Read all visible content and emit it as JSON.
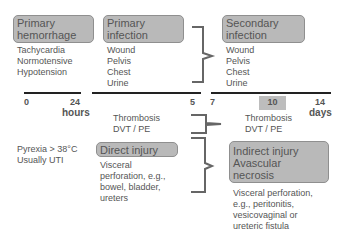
{
  "boxes": {
    "primary_hemorrhage": "Primary hemorrhage",
    "primary_infection": "Primary infection",
    "secondary_infection": "Secondary infection",
    "direct_injury": "Direct injury",
    "indirect_injury": "Indirect injury Avascular necrosis"
  },
  "lists": {
    "hemorrhage_signs": [
      "Tachycardia",
      "Normotensive",
      "Hypotension"
    ],
    "primary_infection_sites": [
      "Wound",
      "Pelvis",
      "Chest",
      "Urine"
    ],
    "secondary_infection_sites": [
      "Wound",
      "Pelvis",
      "Chest",
      "Urine"
    ],
    "pyrexia": [
      "Pyrexia > 38°C",
      "Usually UTI"
    ],
    "thrombosis_early": [
      "Thrombosis",
      "DVT / PE"
    ],
    "thrombosis_late": [
      "Thrombosis",
      "DVT / PE"
    ],
    "direct_injury_detail": [
      "Visceral",
      "perforation, e.g.,",
      "bowel, bladder,",
      "ureters"
    ],
    "indirect_injury_detail": [
      "Visceral perforation,",
      "e.g., peritonitis,",
      "vesicovaginal or",
      "ureteric fistula"
    ]
  },
  "timeline": {
    "hours_ticks": [
      "0",
      "24"
    ],
    "hours_label": "hours",
    "days_ticks": [
      "5",
      "7",
      "10",
      "14"
    ],
    "days_label": "days",
    "highlighted_tick": "10"
  },
  "colors": {
    "box_fill": "#b9b9b9",
    "box_border": "#8f8f8f",
    "axis": "#222222",
    "text": "#555555",
    "brace": "#666666"
  }
}
